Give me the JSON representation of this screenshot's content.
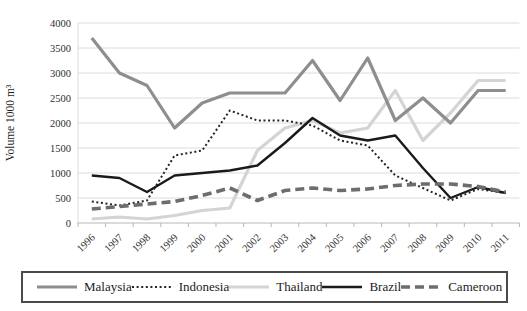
{
  "chart_data": {
    "type": "line",
    "title": "",
    "xlabel": "",
    "ylabel": "Volume 1000 m³",
    "ylim": [
      0,
      4000
    ],
    "ytick_step": 500,
    "grid": true,
    "legend_position": "bottom",
    "categories": [
      "1996",
      "1997",
      "1998",
      "1999",
      "2000",
      "2001",
      "2002",
      "2003",
      "2004",
      "2005",
      "2006",
      "2007",
      "2008",
      "2009",
      "2010",
      "2011"
    ],
    "series": [
      {
        "name": "Malaysia",
        "color": "#8e8e8e",
        "style": "solid",
        "width": 3.2,
        "values": [
          3700,
          3000,
          2750,
          1900,
          2400,
          2600,
          2600,
          2600,
          3250,
          2450,
          3300,
          2050,
          2500,
          2000,
          2650,
          2650
        ]
      },
      {
        "name": "Indonesia",
        "color": "#242424",
        "style": "dotted",
        "width": 2,
        "values": [
          430,
          350,
          450,
          1350,
          1450,
          2250,
          2050,
          2050,
          1950,
          1650,
          1550,
          950,
          700,
          450,
          680,
          600
        ]
      },
      {
        "name": "Thailand",
        "color": "#d4d4d4",
        "style": "solid",
        "width": 3.2,
        "values": [
          80,
          120,
          80,
          150,
          250,
          300,
          1450,
          1900,
          2050,
          1800,
          1900,
          2650,
          1650,
          2200,
          2850,
          2850
        ]
      },
      {
        "name": "Brazil",
        "color": "#1a1a1a",
        "style": "solid",
        "width": 2.4,
        "values": [
          950,
          900,
          620,
          950,
          1000,
          1050,
          1150,
          1600,
          2100,
          1750,
          1650,
          1750,
          1100,
          500,
          720,
          600
        ]
      },
      {
        "name": "Cameroon",
        "color": "#6d6d6d",
        "style": "dashed",
        "width": 3.6,
        "values": [
          280,
          330,
          380,
          430,
          550,
          700,
          450,
          650,
          700,
          650,
          680,
          750,
          780,
          780,
          730,
          620
        ]
      }
    ],
    "axis_colors": {
      "gridline": "#dcdcdc",
      "axis": "#b8b8b8"
    }
  }
}
